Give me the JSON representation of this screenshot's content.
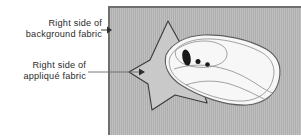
{
  "figure": {
    "background_color": "#ffffff",
    "panel_color": "#b4b4b4",
    "panel_border_color": "#6f6f6f",
    "applique_fill": "#c9c9c9",
    "applique_outline": "#3a3a3a",
    "motif_fill": "#f7f7f7",
    "motif_outline": "#6b6b6b",
    "motif_detail_color": "#1a1a1a",
    "text_color": "#2b2b2b",
    "arrow_color": "#3f3f3f"
  },
  "callouts": [
    {
      "id": "background-fabric",
      "line1": "Right side of",
      "line2": "background fabric",
      "points_to": "background-fabric-panel"
    },
    {
      "id": "applique-fabric",
      "line1": "Right side of",
      "line2": "appliqué fabric",
      "points_to": "applique-star-shape"
    }
  ],
  "shapes": {
    "panel": {
      "name": "background-fabric-panel"
    },
    "star": {
      "name": "applique-star-shape",
      "points": 5
    },
    "motif": {
      "name": "shoe-motif-shape",
      "window_count": 1,
      "dot_count": 2
    }
  }
}
